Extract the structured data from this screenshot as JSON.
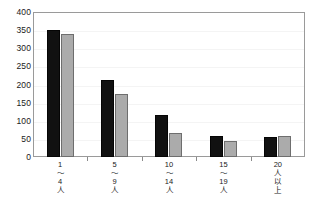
{
  "chart_data": {
    "type": "bar",
    "title": "",
    "subtitle": "",
    "xlabel": "",
    "ylabel": "",
    "categories": [
      "1\n～\n4\n人",
      "5\n～\n9\n人",
      "10\n～\n14\n人",
      "15\n～\n19\n人",
      "20\n人\n以\n上"
    ],
    "category_labels_flat": [
      "1～4人",
      "5～9人",
      "10～14人",
      "15～19人",
      "20人以上"
    ],
    "category_lines": [
      [
        "1",
        "～",
        "4",
        "人"
      ],
      [
        "5",
        "～",
        "9",
        "人"
      ],
      [
        "10",
        "～",
        "14",
        "人"
      ],
      [
        "15",
        "～",
        "19",
        "人"
      ],
      [
        "20",
        "人",
        "以",
        "上"
      ]
    ],
    "series": [
      {
        "name": "series-a",
        "color": "#111111",
        "values": [
          350,
          212,
          115,
          58,
          55
        ]
      },
      {
        "name": "series-b",
        "color": "#ababab",
        "values": [
          340,
          175,
          65,
          45,
          58
        ]
      }
    ],
    "ylim": [
      0,
      400
    ],
    "ytick_step": 50,
    "yticks": [
      "0",
      "50",
      "100",
      "150",
      "200",
      "250",
      "300",
      "350",
      "400"
    ],
    "grid": true,
    "grid_color": "#f4f4f4",
    "legend": null,
    "legend_position": "none",
    "frame_color": "#9a9a9a",
    "background": "#ffffff"
  }
}
